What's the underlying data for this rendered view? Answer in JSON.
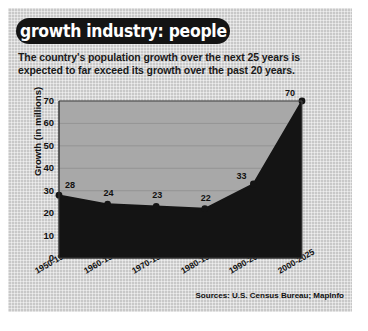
{
  "header": {
    "title": "growth industry: people",
    "subtitle": "The country's population growth over the next 25 years is expected to far exceed its growth over the past 20 years."
  },
  "footer": {
    "sources": "Sources: U.S. Census Bureau; MapInfo"
  },
  "colors": {
    "panel_background": "#c8c8c8",
    "plot_background": "#a8a8a8",
    "series_fill": "#141414",
    "title_pill": "#141414",
    "title_text": "#ffffff",
    "axis_line": "#3a3a3a",
    "text": "#111111"
  },
  "chart_data": {
    "type": "area",
    "title": "growth industry: people",
    "xlabel": "",
    "ylabel": "Growth (in millions)",
    "categories": [
      "1950-1960",
      "1960-1970",
      "1970-1980",
      "1980-1990",
      "1990-2000",
      "2000-2025"
    ],
    "values": [
      28,
      24,
      23,
      22,
      33,
      70
    ],
    "point_labels": [
      "28",
      "24",
      "23",
      "22",
      "33",
      "70"
    ],
    "ylim": [
      0,
      70
    ],
    "yticks": [
      0,
      10,
      20,
      30,
      40,
      50,
      60,
      70
    ],
    "ytick_labels": [
      "0",
      "10",
      "20",
      "30",
      "40",
      "50",
      "60",
      "70"
    ],
    "grid": true,
    "legend": false,
    "markers": true
  }
}
